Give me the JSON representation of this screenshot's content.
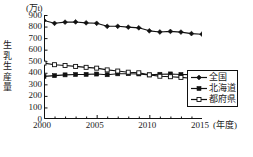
{
  "chart_data": {
    "type": "line",
    "title": "",
    "unit_label": "(万t)",
    "ylabel": "生乳生産量",
    "xlabel": "(年度)",
    "ylim": [
      0,
      900
    ],
    "yticks": [
      900,
      800,
      700,
      600,
      500,
      400,
      300,
      200,
      100,
      0
    ],
    "xlim": [
      2000,
      2015
    ],
    "xticks": [
      2000,
      2005,
      2010,
      2015
    ],
    "x": [
      2000,
      2001,
      2002,
      2003,
      2004,
      2005,
      2006,
      2007,
      2008,
      2009,
      2010,
      2011,
      2012,
      2013,
      2014,
      2015
    ],
    "grid": false,
    "legend_position": "bottom-right",
    "series": [
      {
        "name": "全国",
        "marker": "filled-diamond",
        "values": [
          853,
          828,
          838,
          840,
          832,
          828,
          802,
          802,
          795,
          789,
          763,
          753,
          758,
          752,
          739,
          734
        ]
      },
      {
        "name": "北海道",
        "marker": "filled-square",
        "values": [
          369,
          375,
          382,
          385,
          386,
          389,
          383,
          391,
          392,
          390,
          382,
          387,
          390,
          385,
          384,
          390
        ]
      },
      {
        "name": "都府県",
        "marker": "open-square",
        "values": [
          484,
          470,
          463,
          455,
          447,
          440,
          425,
          415,
          405,
          400,
          382,
          370,
          366,
          360,
          352,
          345
        ]
      }
    ]
  }
}
